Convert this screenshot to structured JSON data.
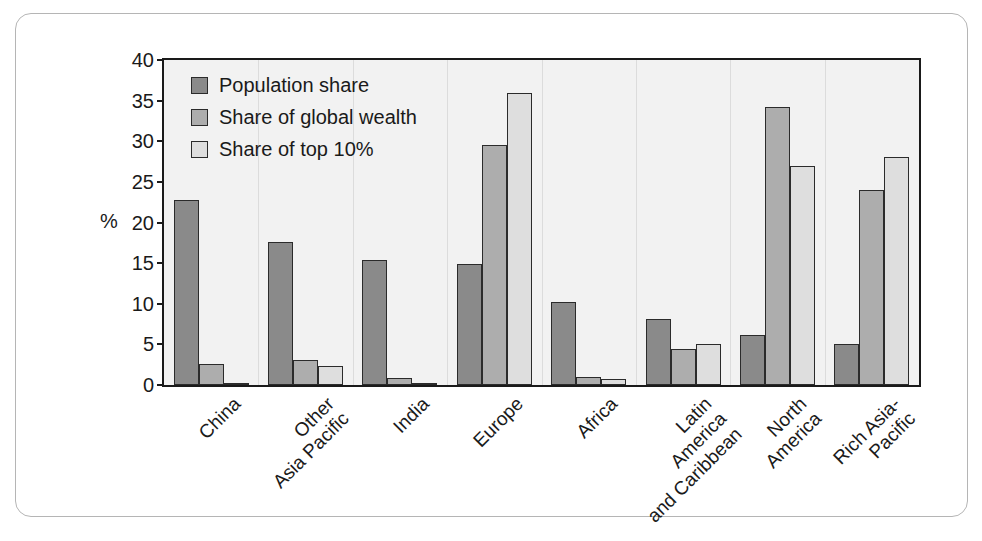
{
  "chart_data": {
    "type": "bar",
    "title": "",
    "xlabel": "",
    "ylabel": "%",
    "ylim": [
      0,
      40
    ],
    "ytick_step": 5,
    "yticks": [
      40,
      35,
      30,
      25,
      20,
      15,
      10,
      5,
      0
    ],
    "grid": "group-separators",
    "legend_position": "top-left-inside",
    "categories": [
      "China",
      "Other\nAsia Pacific",
      "India",
      "Europe",
      "Africa",
      "Latin\nAmerica\nand Caribbean",
      "North\nAmerica",
      "Rich Asia-\nPacific"
    ],
    "category_lines": [
      [
        "China"
      ],
      [
        "Other",
        "Asia Pacific"
      ],
      [
        "India"
      ],
      [
        "Europe"
      ],
      [
        "Africa"
      ],
      [
        "Latin",
        "America",
        "and Caribbean"
      ],
      [
        "North",
        "America"
      ],
      [
        "Rich Asia-",
        "Pacific"
      ]
    ],
    "series": [
      {
        "name": "Population share",
        "color": "#8a8a8a",
        "values": [
          22.8,
          17.6,
          15.4,
          14.9,
          10.2,
          8.1,
          6.1,
          5.0
        ]
      },
      {
        "name": "Share of global wealth",
        "color": "#adadad",
        "values": [
          2.6,
          3.1,
          0.9,
          29.5,
          1.0,
          4.4,
          34.2,
          24.0
        ]
      },
      {
        "name": "Share of top 10%",
        "color": "#dedede",
        "values": [
          0.3,
          2.4,
          0.3,
          36.0,
          0.7,
          5.0,
          27.0,
          28.1
        ]
      }
    ]
  },
  "legend": {
    "items": [
      {
        "label": "Population share",
        "color": "#8a8a8a"
      },
      {
        "label": "Share of global wealth",
        "color": "#adadad"
      },
      {
        "label": "Share of top 10%",
        "color": "#dedede"
      }
    ]
  },
  "axis": {
    "y_title": "%"
  },
  "caption": {
    "text": ""
  }
}
